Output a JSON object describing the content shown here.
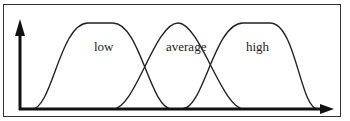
{
  "diagram": {
    "type": "fuzzy-membership-functions",
    "colors": {
      "line": "#222222",
      "axis": "#111111",
      "frame": "#333333",
      "background": "#ffffff"
    },
    "sets": [
      {
        "name": "low",
        "label": "low",
        "shape": "trapezoid-smooth"
      },
      {
        "name": "average",
        "label": "average",
        "shape": "bell"
      },
      {
        "name": "high",
        "label": "high",
        "shape": "trapezoid-smooth"
      }
    ],
    "axes": {
      "x_arrow": true,
      "y_arrow": true
    }
  }
}
